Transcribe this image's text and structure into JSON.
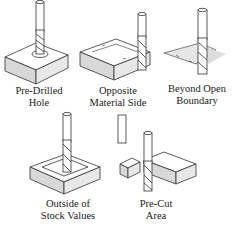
{
  "diagram": {
    "title": "",
    "panels": [
      {
        "id": "pre-drilled-hole",
        "caption": [
          "Pre-Drilled",
          "Hole"
        ]
      },
      {
        "id": "opposite-material-side",
        "caption": [
          "Opposite",
          "Material Side"
        ]
      },
      {
        "id": "beyond-open-boundary",
        "caption": [
          "Beyond Open",
          "Boundary"
        ]
      },
      {
        "id": "outside-of-stock-values",
        "caption": [
          "Outside of",
          "Stock Values"
        ]
      },
      {
        "id": "pre-cut-area",
        "caption": [
          "Pre-Cut",
          "Area"
        ]
      }
    ],
    "colors": {
      "line": "#333333",
      "face_top": "#ffffff",
      "face_side": "#e2e2e2",
      "face_front": "#d6d6d6",
      "shadow": "#cfcfcf"
    }
  }
}
